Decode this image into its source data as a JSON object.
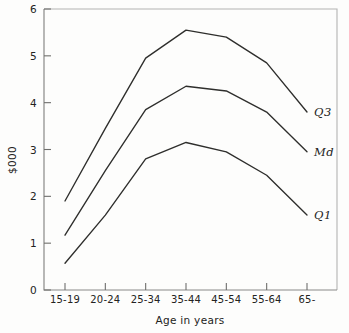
{
  "chart_data": {
    "type": "line",
    "title": "",
    "xlabel": "Age in years",
    "ylabel": "$000",
    "categories": [
      "15-19",
      "20-24",
      "25-34",
      "35-44",
      "45-54",
      "55-64",
      "65-"
    ],
    "ylim": [
      0,
      6
    ],
    "yticks": [
      0,
      1,
      2,
      3,
      4,
      5,
      6
    ],
    "ytick_labels": [
      "0",
      "1",
      "2",
      "3",
      "4",
      "5",
      "6"
    ],
    "grid": false,
    "legend": "inline-right-endpoint-labels",
    "series": [
      {
        "name": "Q3",
        "label": "Q3",
        "values": [
          1.9,
          3.45,
          4.95,
          5.55,
          5.4,
          4.85,
          3.8
        ]
      },
      {
        "name": "Md",
        "label": "Md",
        "values": [
          1.17,
          2.55,
          3.85,
          4.35,
          4.25,
          3.8,
          2.95
        ]
      },
      {
        "name": "Q1",
        "label": "Q1",
        "values": [
          0.57,
          1.6,
          2.8,
          3.15,
          2.95,
          2.45,
          1.6
        ]
      }
    ]
  },
  "axis": {
    "y_title": "$000",
    "x_title": "Age in years"
  }
}
